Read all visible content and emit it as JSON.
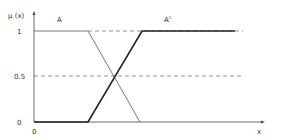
{
  "diagram": {
    "title": "",
    "y_axis_label": "μ (x)",
    "x_axis_label": "x",
    "origin_label": "0",
    "y_ticks": [
      {
        "label": "1",
        "value": 1
      },
      {
        "label": "0.5",
        "value": 0.5
      },
      {
        "label": "0",
        "value": 0
      }
    ],
    "sets": [
      {
        "name": "A",
        "label": "A",
        "description": "fuzzy set A: 1 then decreasing linearly to 0"
      },
      {
        "name": "A_complement",
        "label": "A",
        "superscript": "c",
        "description": "complement of A: 0 then increasing linearly to 1"
      }
    ],
    "reference_lines": [
      {
        "level": 1,
        "style": "dashed"
      },
      {
        "level": 0.5,
        "style": "dashed"
      }
    ]
  }
}
